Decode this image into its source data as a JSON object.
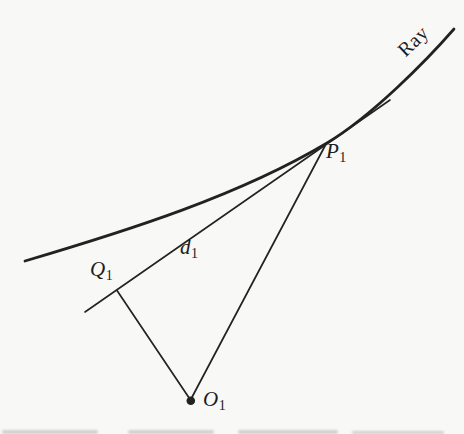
{
  "figure": {
    "colors": {
      "ink": "#222222",
      "background": "#f8f8f6"
    },
    "labels": {
      "ray": "Ray",
      "p1": {
        "main": "P",
        "sub": "1"
      },
      "q1": {
        "main": "Q",
        "sub": "1"
      },
      "d1": {
        "main": "d",
        "sub": "1"
      },
      "o1": {
        "main": "O",
        "sub": "1"
      }
    }
  }
}
